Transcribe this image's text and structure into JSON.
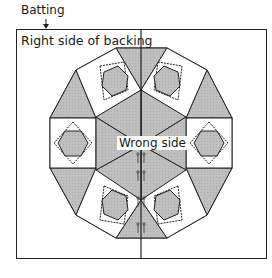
{
  "diagram": {
    "labels": {
      "batting": "Batting",
      "backing": "Right side of backing",
      "quilt_top": "Wrong side"
    },
    "colors": {
      "outline": "#222222",
      "fill_gray": "#bdbdbd",
      "fill_light": "#d0d0d0",
      "background": "#ffffff"
    },
    "elements": {
      "outer_rectangle": "backing sheet",
      "center_fold_line": "vertical line",
      "block_shape": "dodecagon quilt top",
      "center_hexagon_triangles": 6,
      "square_in_square_units": 6,
      "outer_triangles": 6,
      "pins_along_center": 8
    }
  }
}
